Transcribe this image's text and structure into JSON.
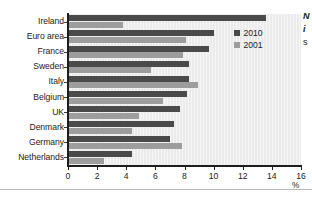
{
  "chart_data": {
    "type": "bar",
    "orientation": "horizontal",
    "title": "",
    "xlabel": "%",
    "ylabel": "",
    "xlim": [
      0,
      16
    ],
    "xticks": [
      0,
      2,
      4,
      6,
      8,
      10,
      12,
      14,
      16
    ],
    "grid": false,
    "legend_position": "top-right",
    "categories": [
      "Ireland",
      "Euro area",
      "France",
      "Sweden",
      "Italy",
      "Belgium",
      "UK",
      "Denmark",
      "Germany",
      "Netherlands"
    ],
    "series": [
      {
        "name": "2010",
        "color": "#4a4a4a",
        "values": [
          13.6,
          10.0,
          9.7,
          8.3,
          8.3,
          8.2,
          7.7,
          7.3,
          7.0,
          4.4
        ]
      },
      {
        "name": "2001",
        "color": "#9d9d9d",
        "values": [
          3.8,
          8.1,
          7.9,
          5.7,
          8.9,
          6.5,
          4.9,
          4.4,
          7.8,
          2.5
        ]
      }
    ]
  },
  "legend": {
    "entries": [
      {
        "label": "2010",
        "swatch": "#4a4a4a"
      },
      {
        "label": "2001",
        "swatch": "#9d9d9d"
      }
    ]
  },
  "axis": {
    "x_unit": "%",
    "x_tick_labels": [
      "0",
      "2",
      "4",
      "6",
      "8",
      "10",
      "12",
      "14",
      "16"
    ]
  },
  "margin_note": {
    "lines": [
      "N",
      "i",
      "s"
    ]
  }
}
